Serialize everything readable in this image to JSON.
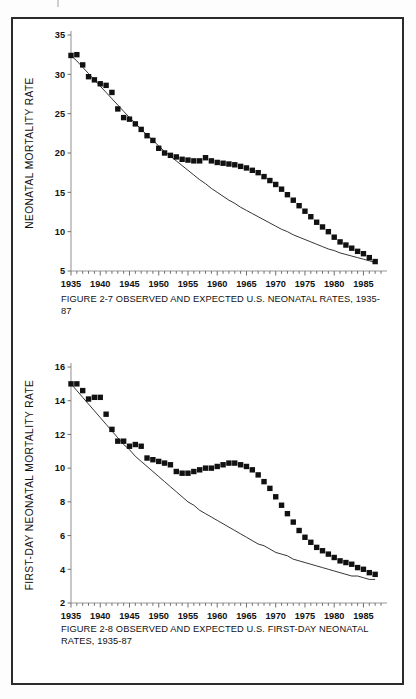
{
  "page": {
    "background": "#ffffff",
    "frame_color": "#2b2b2b",
    "ink_color": "#111111"
  },
  "figures": [
    {
      "id": "figure-2-7",
      "caption": "FIGURE 2-7  OBSERVED AND EXPECTED U.S. NEONATAL RATES, 1935-87"
    },
    {
      "id": "figure-2-8",
      "caption": "FIGURE 2-8  OBSERVED AND EXPECTED U.S. FIRST-DAY NEONATAL RATES, 1935-87"
    }
  ],
  "chart_data": [
    {
      "type": "line",
      "id": "figure-2-7",
      "title": "FIGURE 2-7  OBSERVED AND EXPECTED U.S. NEONATAL RATES, 1935-87",
      "xlabel": "",
      "ylabel": "NEONATAL MORTALITY RATE",
      "xlim": [
        1935,
        1988
      ],
      "ylim": [
        5,
        35
      ],
      "yticks": [
        5,
        10,
        15,
        20,
        25,
        30,
        35
      ],
      "xticks": [
        1935,
        1940,
        1945,
        1950,
        1955,
        1960,
        1965,
        1970,
        1975,
        1980,
        1985
      ],
      "xtick_labels": [
        "1935",
        "1940",
        "1945",
        "1950",
        "1955",
        "1960",
        "1965",
        "1970",
        "1975",
        "1980",
        "1985"
      ],
      "ytick_labels": [
        "5",
        "10",
        "15",
        "20",
        "25",
        "30",
        "35"
      ],
      "xtick_minor_step": 1,
      "grid": false,
      "legend": "none",
      "x": [
        1935,
        1936,
        1937,
        1938,
        1939,
        1940,
        1941,
        1942,
        1943,
        1944,
        1945,
        1946,
        1947,
        1948,
        1949,
        1950,
        1951,
        1952,
        1953,
        1954,
        1955,
        1956,
        1957,
        1958,
        1959,
        1960,
        1961,
        1962,
        1963,
        1964,
        1965,
        1966,
        1967,
        1968,
        1969,
        1970,
        1971,
        1972,
        1973,
        1974,
        1975,
        1976,
        1977,
        1978,
        1979,
        1980,
        1981,
        1982,
        1983,
        1984,
        1985,
        1986,
        1987
      ],
      "series": [
        {
          "name": "Observed",
          "marker": "filled-square",
          "values": [
            32.4,
            32.5,
            31.2,
            29.7,
            29.3,
            28.8,
            28.6,
            27.7,
            25.6,
            24.5,
            24.3,
            23.7,
            23.0,
            22.2,
            21.6,
            20.6,
            20.0,
            19.7,
            19.5,
            19.2,
            19.1,
            19.0,
            19.0,
            19.4,
            19.0,
            18.8,
            18.7,
            18.6,
            18.5,
            18.3,
            18.1,
            17.8,
            17.5,
            17.0,
            16.5,
            16.0,
            15.4,
            14.7,
            14.0,
            13.3,
            12.6,
            11.9,
            11.2,
            10.6,
            10.0,
            9.3,
            8.7,
            8.3,
            7.9,
            7.5,
            7.2,
            6.7,
            6.2
          ]
        },
        {
          "name": "Expected",
          "marker": "none",
          "values": [
            32.4,
            31.7,
            30.9,
            30.1,
            29.3,
            28.5,
            27.7,
            26.9,
            26.1,
            25.3,
            24.5,
            23.8,
            23.0,
            22.3,
            21.6,
            20.9,
            20.2,
            19.6,
            19.0,
            18.4,
            17.8,
            17.2,
            16.6,
            16.1,
            15.5,
            15.0,
            14.5,
            14.0,
            13.6,
            13.1,
            12.7,
            12.3,
            11.9,
            11.5,
            11.1,
            10.7,
            10.3,
            10.0,
            9.6,
            9.3,
            9.0,
            8.7,
            8.4,
            8.1,
            7.8,
            7.6,
            7.3,
            7.1,
            6.9,
            6.7,
            6.5,
            6.3,
            6.1
          ]
        }
      ]
    },
    {
      "type": "line",
      "id": "figure-2-8",
      "title": "FIGURE 2-8  OBSERVED AND EXPECTED U.S. FIRST-DAY NEONATAL RATES, 1935-87",
      "xlabel": "",
      "ylabel": "FIRST-DAY NEONATAL MORTALITY RATE",
      "xlim": [
        1935,
        1988
      ],
      "ylim": [
        2,
        16
      ],
      "yticks": [
        2,
        4,
        6,
        8,
        10,
        12,
        14,
        16
      ],
      "xticks": [
        1935,
        1940,
        1945,
        1950,
        1955,
        1960,
        1965,
        1970,
        1975,
        1980,
        1985
      ],
      "xtick_labels": [
        "1935",
        "1940",
        "1945",
        "1950",
        "1955",
        "1960",
        "1965",
        "1970",
        "1975",
        "1980",
        "1985"
      ],
      "ytick_labels": [
        "2",
        "4",
        "6",
        "8",
        "10",
        "12",
        "14",
        "16"
      ],
      "xtick_minor_step": 1,
      "grid": false,
      "legend": "none",
      "x": [
        1935,
        1936,
        1937,
        1938,
        1939,
        1940,
        1941,
        1942,
        1943,
        1944,
        1945,
        1946,
        1947,
        1948,
        1949,
        1950,
        1951,
        1952,
        1953,
        1954,
        1955,
        1956,
        1957,
        1958,
        1959,
        1960,
        1961,
        1962,
        1963,
        1964,
        1965,
        1966,
        1967,
        1968,
        1969,
        1970,
        1971,
        1972,
        1973,
        1974,
        1975,
        1976,
        1977,
        1978,
        1979,
        1980,
        1981,
        1982,
        1983,
        1984,
        1985,
        1986,
        1987
      ],
      "series": [
        {
          "name": "Observed",
          "marker": "filled-square",
          "values": [
            15.0,
            15.0,
            14.6,
            14.1,
            14.2,
            14.2,
            13.2,
            12.3,
            11.6,
            11.6,
            11.3,
            11.4,
            11.3,
            10.6,
            10.5,
            10.4,
            10.3,
            10.2,
            9.8,
            9.7,
            9.7,
            9.8,
            9.9,
            10.0,
            10.0,
            10.1,
            10.2,
            10.3,
            10.3,
            10.2,
            10.1,
            9.9,
            9.6,
            9.2,
            8.8,
            8.3,
            7.8,
            7.3,
            6.8,
            6.3,
            5.9,
            5.6,
            5.3,
            5.1,
            4.9,
            4.7,
            4.5,
            4.4,
            4.3,
            4.1,
            4.0,
            3.8,
            3.7
          ]
        },
        {
          "name": "Expected",
          "marker": "none",
          "values": [
            15.0,
            14.6,
            14.2,
            13.8,
            13.4,
            13.0,
            12.6,
            12.2,
            11.8,
            11.4,
            11.1,
            10.7,
            10.4,
            10.1,
            9.8,
            9.5,
            9.2,
            8.9,
            8.6,
            8.3,
            8.0,
            7.8,
            7.5,
            7.3,
            7.1,
            6.9,
            6.7,
            6.5,
            6.3,
            6.1,
            5.9,
            5.7,
            5.5,
            5.4,
            5.2,
            5.0,
            4.9,
            4.8,
            4.6,
            4.5,
            4.4,
            4.3,
            4.2,
            4.1,
            4.0,
            3.9,
            3.8,
            3.7,
            3.6,
            3.6,
            3.5,
            3.4,
            3.4
          ]
        }
      ]
    }
  ]
}
